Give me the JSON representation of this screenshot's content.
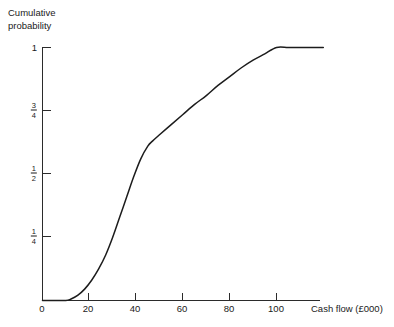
{
  "chart_data": {
    "type": "line",
    "title": "",
    "subtitle": "",
    "xlabel": "Cash flow (£000)",
    "ylabel": "Cumulative probability",
    "ylabel_lines": [
      "Cumulative",
      "probability"
    ],
    "grid": false,
    "legend": "none",
    "xlim": [
      0,
      120
    ],
    "ylim": [
      0,
      1
    ],
    "x_ticks": [
      {
        "value": 0,
        "label": "0"
      },
      {
        "value": 20,
        "label": "20"
      },
      {
        "value": 40,
        "label": "40"
      },
      {
        "value": 60,
        "label": "60"
      },
      {
        "value": 80,
        "label": "80"
      },
      {
        "value": 100,
        "label": "100"
      }
    ],
    "y_ticks": [
      {
        "value": 0.25,
        "label": "1/4",
        "numerator": "1",
        "denominator": "4"
      },
      {
        "value": 0.5,
        "label": "1/2",
        "numerator": "1",
        "denominator": "2"
      },
      {
        "value": 0.75,
        "label": "3/4",
        "numerator": "3",
        "denominator": "4"
      },
      {
        "value": 1,
        "label": "1",
        "numerator": "",
        "denominator": ""
      }
    ],
    "series": [
      {
        "name": "Cumulative probability of cash flow",
        "color": "#1c1c1c",
        "x": [
          0,
          5,
          10,
          12,
          15,
          18,
          21,
          24,
          27,
          30,
          33,
          36,
          39,
          42,
          45,
          47,
          50,
          55,
          60,
          65,
          70,
          75,
          80,
          85,
          90,
          95,
          100,
          105,
          110,
          115,
          120
        ],
        "y": [
          0,
          0,
          0,
          0.005,
          0.02,
          0.045,
          0.08,
          0.125,
          0.18,
          0.25,
          0.33,
          0.41,
          0.49,
          0.56,
          0.61,
          0.63,
          0.655,
          0.695,
          0.735,
          0.775,
          0.81,
          0.85,
          0.885,
          0.92,
          0.95,
          0.975,
          1,
          1,
          1,
          1,
          1
        ]
      }
    ],
    "annotations": {
      "flat_start_x": 0,
      "takeoff_x": 11,
      "inflection_x": 38,
      "knee_x": 47,
      "knee_y": 0.63,
      "saturation_x": 100,
      "saturation_y": 1
    }
  },
  "axes": {
    "x_axis_name": "cash-flow-axis",
    "y_axis_name": "cumulative-probability-axis"
  }
}
